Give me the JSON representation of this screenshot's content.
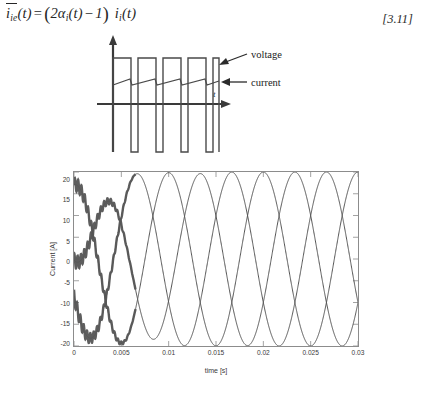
{
  "equation": {
    "lhs_var": "i",
    "lhs_sub": "ie",
    "lhs_arg": "(t)",
    "equals": "=",
    "open_paren": "(",
    "coef": "2",
    "alpha": "α",
    "alpha_sub": "i",
    "alpha_arg": "(t)",
    "minus": "−",
    "one": "1",
    "close_paren": ")",
    "rhs_var": "i",
    "rhs_sub": "i",
    "rhs_arg": "(t)",
    "plain": "i̅_ie(t) = (2α_i(t) − 1) i_i(t)",
    "reference": "[3.11]"
  },
  "figure_a": {
    "caption": "a)",
    "axis_label": "t",
    "labels": {
      "voltage": "voltage",
      "current": "current"
    },
    "arrow_icon": "left-arrow-icon",
    "pulse_count": 5,
    "description": "Square-wave voltage with superimposed sawtooth current ripple on a time axis"
  },
  "figure_b": {
    "caption": "b)"
  },
  "colors": {
    "ink": "#1a1a1a",
    "trace": "#555555",
    "axis": "#8c8c8c",
    "tick_text": "#3a3a3a"
  },
  "chart_data": {
    "type": "line",
    "title": "",
    "xlabel": "time [s]",
    "ylabel": "Current [A]",
    "xlim": [
      0,
      0.03
    ],
    "ylim": [
      -20,
      20
    ],
    "xticks": [
      0,
      0.005,
      0.01,
      0.015,
      0.02,
      0.025,
      0.03
    ],
    "xticklabels": [
      "0",
      "0.005",
      "0.01",
      "0.015",
      "0.02",
      "0.025",
      "0.03"
    ],
    "yticks": [
      20,
      15,
      10,
      5,
      0,
      -5,
      -10,
      -15,
      -20
    ],
    "yticklabels": [
      "20",
      "15",
      "10",
      "5",
      "0",
      "-5",
      "-10",
      "-15",
      "-20"
    ],
    "grid": false,
    "legend": null,
    "amplitude": 20,
    "frequency_hz": 100,
    "period_s": 0.01,
    "series": [
      {
        "name": "phase-a",
        "phase_deg": 90,
        "comment": "starts near +17 A, decays through 0 at ~0.0075 s, then sinusoidal",
        "x": [
          0,
          0.0025,
          0.005,
          0.0075,
          0.01,
          0.0125,
          0.015,
          0.0175,
          0.02,
          0.0225,
          0.025,
          0.0275,
          0.03
        ],
        "values": [
          17,
          14.5,
          9.5,
          -1,
          -12,
          -19.5,
          -15,
          -2,
          12,
          19.5,
          14,
          0.5,
          -13
        ]
      },
      {
        "name": "phase-b",
        "phase_deg": -30,
        "comment": "starts near 0 A rising, peaks ~20 A at 0.0085 s",
        "x": [
          0,
          0.0025,
          0.005,
          0.0075,
          0.01,
          0.0125,
          0.015,
          0.0175,
          0.02,
          0.0225,
          0.025,
          0.0275,
          0.03
        ],
        "values": [
          -0.5,
          4.5,
          10.5,
          17.5,
          19,
          13,
          1.5,
          -12,
          -19.5,
          -16,
          -4,
          10,
          19
        ]
      },
      {
        "name": "phase-c",
        "phase_deg": -150,
        "comment": "starts near -17 A, dips to -20 A near 0.005 s, then sinusoidal",
        "x": [
          0,
          0.0025,
          0.005,
          0.0075,
          0.01,
          0.0125,
          0.015,
          0.0175,
          0.02,
          0.0225,
          0.025,
          0.0275,
          0.03
        ],
        "values": [
          -17,
          -18.5,
          -19.8,
          -17,
          -8,
          6.5,
          17.5,
          19.5,
          11,
          -3,
          -15.5,
          -19.8,
          -12
        ]
      }
    ]
  }
}
